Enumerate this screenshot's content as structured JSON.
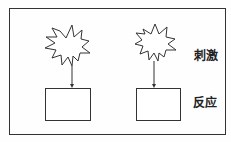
{
  "diagram": {
    "labels": {
      "stimulus": "刺激",
      "response": "反应"
    },
    "colors": {
      "stroke": "#333333",
      "background": "#fefefe"
    },
    "nodes": [
      {
        "type": "starburst",
        "role": "stimulus",
        "index": 1
      },
      {
        "type": "rectangle",
        "role": "response",
        "index": 1
      },
      {
        "type": "starburst",
        "role": "stimulus",
        "index": 2
      },
      {
        "type": "rectangle",
        "role": "response",
        "index": 2
      }
    ],
    "edges": [
      {
        "from": "stimulus-1",
        "to": "response-1",
        "style": "arrow"
      },
      {
        "from": "stimulus-2",
        "to": "response-2",
        "style": "arrow"
      }
    ]
  }
}
